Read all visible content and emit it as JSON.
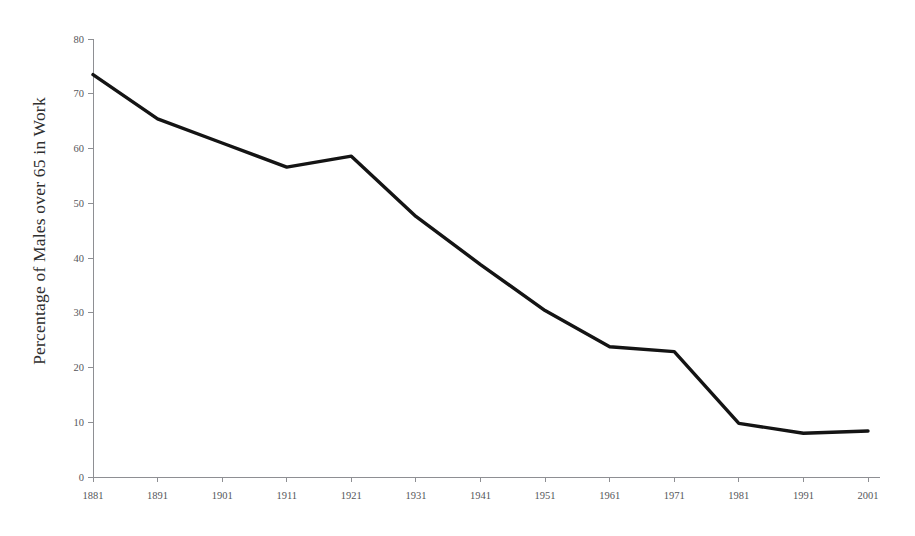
{
  "chart_data": {
    "type": "line",
    "title": "",
    "subtitle": "",
    "xlabel": "",
    "ylabel": "Percentage of Males over 65 in Work",
    "categories": [
      "1881",
      "1891",
      "1901",
      "1911",
      "1921",
      "1931",
      "1941",
      "1951",
      "1961",
      "1971",
      "1981",
      "1991",
      "2001"
    ],
    "x": [
      1881,
      1891,
      1901,
      1911,
      1921,
      1931,
      1941,
      1951,
      1961,
      1971,
      1981,
      1991,
      2001
    ],
    "values": [
      73.5,
      65.4,
      61.0,
      56.6,
      58.6,
      47.6,
      38.8,
      30.4,
      23.8,
      22.9,
      9.8,
      8.0,
      8.4
    ],
    "series": [
      {
        "name": "Percentage of Males over 65 in Work",
        "values": [
          73.5,
          65.4,
          61.0,
          56.6,
          58.6,
          47.6,
          38.8,
          30.4,
          23.8,
          22.9,
          9.8,
          8.0,
          8.4
        ],
        "color": "#141414"
      }
    ],
    "ylim": [
      0,
      80
    ],
    "yticks": [
      0,
      10,
      20,
      30,
      40,
      50,
      60,
      70,
      80
    ],
    "ytick_labels": [
      "0",
      "10",
      "20",
      "30",
      "40",
      "50",
      "60",
      "70",
      "80"
    ],
    "xticks": [
      1881,
      1891,
      1901,
      1911,
      1921,
      1931,
      1941,
      1951,
      1961,
      1971,
      1981,
      1991,
      2001
    ],
    "xtick_labels": [
      "1881",
      "1891",
      "1901",
      "1911",
      "1921",
      "1931",
      "1941",
      "1951",
      "1961",
      "1971",
      "1981",
      "1991",
      "2001"
    ],
    "grid": false,
    "legend": false,
    "legend_position": "none",
    "background_color": "#ffffff",
    "axis_color": "#8e8f93",
    "tick_label_color": "#55565a",
    "line_color": "#141414"
  },
  "axis": {
    "y_title": "Percentage of Males over 65 in Work"
  }
}
